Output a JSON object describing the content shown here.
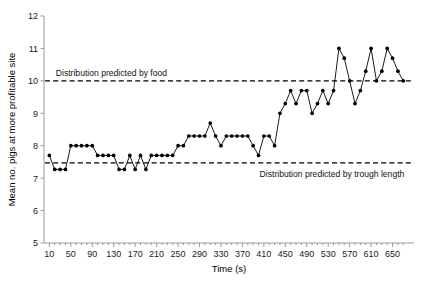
{
  "chart_data": {
    "type": "line",
    "title": "",
    "xlabel": "Time (s)",
    "ylabel": "Mean no. pigs at more profitable site",
    "xlim": [
      0,
      690
    ],
    "ylim": [
      5,
      12
    ],
    "grid": false,
    "legend": "none",
    "xticks": [
      10,
      50,
      90,
      130,
      170,
      210,
      250,
      290,
      330,
      370,
      410,
      450,
      490,
      530,
      570,
      610,
      650
    ],
    "yticks": [
      5,
      6,
      7,
      8,
      9,
      10,
      11,
      12
    ],
    "marker": "filled-circle",
    "series": [
      {
        "name": "Mean no. pigs at more profitable site",
        "x": [
          10,
          20,
          30,
          40,
          50,
          60,
          70,
          80,
          90,
          100,
          110,
          120,
          130,
          140,
          150,
          160,
          170,
          180,
          190,
          200,
          210,
          220,
          230,
          240,
          250,
          260,
          270,
          280,
          290,
          300,
          310,
          320,
          330,
          340,
          350,
          360,
          370,
          380,
          390,
          400,
          410,
          420,
          430,
          440,
          450,
          460,
          470,
          480,
          490,
          500,
          510,
          520,
          530,
          540,
          550,
          560,
          570,
          580,
          590,
          600,
          610,
          620,
          630,
          640,
          650,
          660,
          670
        ],
        "values": [
          7.7,
          7.27,
          7.27,
          7.27,
          8.0,
          8.0,
          8.0,
          8.0,
          8.0,
          7.7,
          7.7,
          7.7,
          7.7,
          7.27,
          7.27,
          7.7,
          7.27,
          7.7,
          7.27,
          7.7,
          7.7,
          7.7,
          7.7,
          7.7,
          8.0,
          8.0,
          8.3,
          8.3,
          8.3,
          8.3,
          8.7,
          8.3,
          8.0,
          8.3,
          8.3,
          8.3,
          8.3,
          8.3,
          8.0,
          7.7,
          8.3,
          8.3,
          8.0,
          9.0,
          9.3,
          9.7,
          9.3,
          9.7,
          9.7,
          9.0,
          9.3,
          9.7,
          9.3,
          9.7,
          11.0,
          10.7,
          10.0,
          9.3,
          9.7,
          10.3,
          11.0,
          10.0,
          10.3,
          11.0,
          10.7,
          10.3,
          10.0
        ]
      }
    ],
    "reference_lines": [
      {
        "label": "Distribution predicted by food",
        "value": 10.0
      },
      {
        "label": "Distribution predicted by trough length",
        "value": 7.47
      }
    ]
  }
}
